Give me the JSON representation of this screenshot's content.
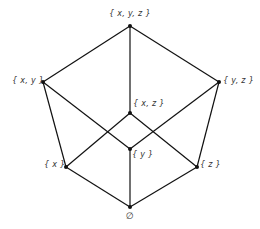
{
  "diagram": {
    "type": "hasse-diagram",
    "line_color": "#111111",
    "nodes": [
      {
        "id": "xyz",
        "label": "{ x, y, z }",
        "x": 130,
        "y": 26
      },
      {
        "id": "xy",
        "label": "{ x, y }",
        "x": 43,
        "y": 82
      },
      {
        "id": "yz",
        "label": "{ y, z }",
        "x": 219,
        "y": 82
      },
      {
        "id": "xz",
        "label": "{ x, z }",
        "x": 130,
        "y": 113
      },
      {
        "id": "y",
        "label": "{ y }",
        "x": 130,
        "y": 149
      },
      {
        "id": "x",
        "label": "{ x }",
        "x": 66,
        "y": 167
      },
      {
        "id": "z",
        "label": "{ z }",
        "x": 197,
        "y": 167
      },
      {
        "id": "empty",
        "label": "∅",
        "x": 130,
        "y": 207
      }
    ],
    "edges": [
      [
        "xyz",
        "xy"
      ],
      [
        "xyz",
        "yz"
      ],
      [
        "xyz",
        "xz"
      ],
      [
        "xy",
        "x"
      ],
      [
        "xy",
        "y"
      ],
      [
        "yz",
        "y"
      ],
      [
        "yz",
        "z"
      ],
      [
        "xz",
        "x"
      ],
      [
        "xz",
        "z"
      ],
      [
        "x",
        "empty"
      ],
      [
        "y",
        "empty"
      ],
      [
        "z",
        "empty"
      ]
    ]
  }
}
